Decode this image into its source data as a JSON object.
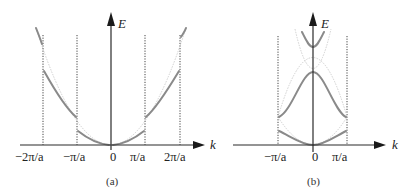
{
  "figure": {
    "panels": [
      {
        "id": "a",
        "caption": "(a)",
        "y_axis_label": "E",
        "x_axis_label": "k",
        "tick_labels": [
          "−2π/a",
          "−π/a",
          "0",
          "π/a",
          "2π/a"
        ],
        "description": "Extended zone scheme: free-electron parabola with band gaps opening at k = ±π/a and ±2π/a"
      },
      {
        "id": "b",
        "caption": "(b)",
        "y_axis_label": "E",
        "x_axis_label": "k",
        "tick_labels": [
          "−π/a",
          "0",
          "π/a"
        ],
        "description": "Reduced zone scheme: bands folded into first Brillouin zone −π/a ≤ k ≤ π/a"
      }
    ]
  },
  "colors": {
    "band_curve": "#8a8a8a",
    "free_electron_curve": "#c4c4c4",
    "axis": "#2a2a2a",
    "zone_boundary": "#444444"
  }
}
